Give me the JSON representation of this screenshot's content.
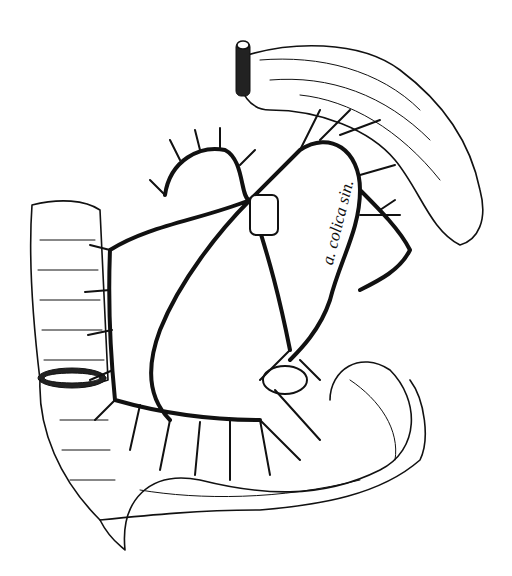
{
  "figure": {
    "labels": [
      {
        "id": "label-a-colica-sin",
        "text": "a. colica sin."
      }
    ],
    "colors": {
      "ink": "#111111",
      "background": "#ffffff"
    }
  }
}
